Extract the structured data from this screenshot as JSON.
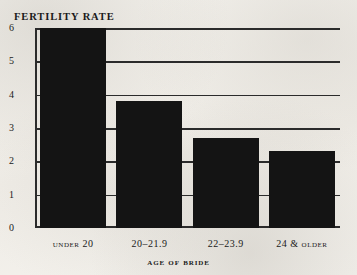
{
  "chart_data": {
    "type": "bar",
    "title": "Fertility Rate",
    "xlabel": "Age of Bride",
    "ylabel": "",
    "categories": [
      "Under 20",
      "20–21.9",
      "22–23.9",
      "24 & older"
    ],
    "values": [
      6.0,
      3.8,
      2.7,
      2.3
    ],
    "ylim": [
      0,
      6
    ],
    "yticks": [
      "0",
      "1",
      "2",
      "3",
      "4",
      "5",
      "6"
    ],
    "ytick_values": [
      0,
      1,
      2,
      3,
      4,
      5,
      6
    ],
    "grid": true,
    "legend": false,
    "bar_color": "#141414",
    "axis_color": "#2b2b2b",
    "background_color": "#f3f1ec"
  }
}
